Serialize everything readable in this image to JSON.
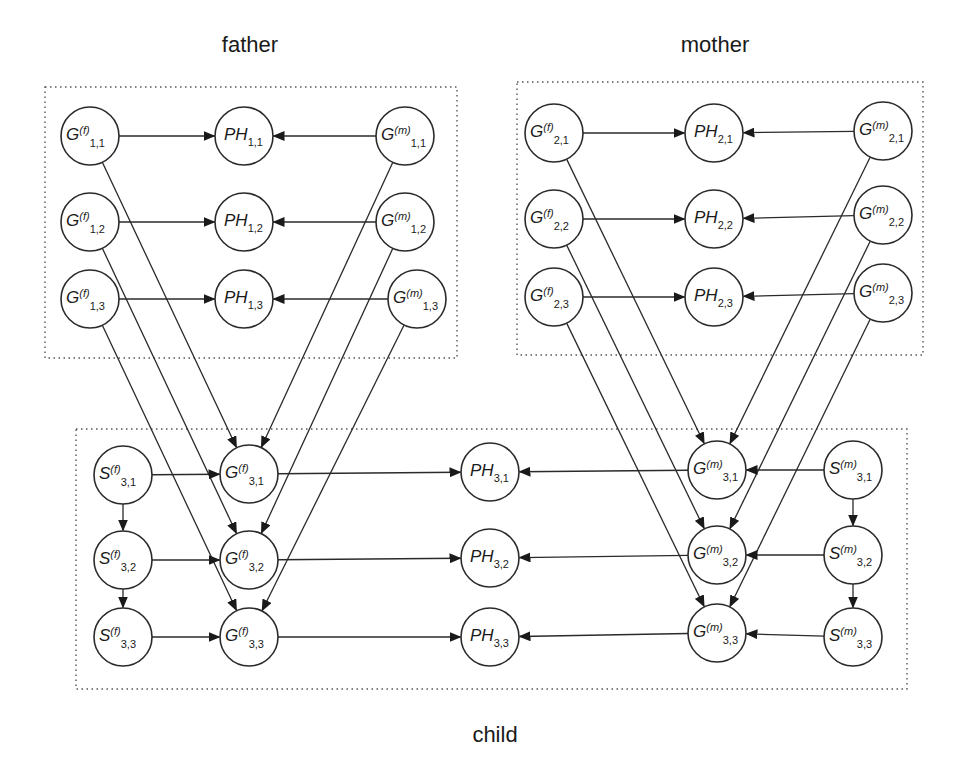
{
  "diagram": {
    "title_father": "father",
    "title_mother": "mother",
    "title_child": "child",
    "node_radius": 29,
    "colors": {
      "stroke": "#2a2a2a",
      "fill": "#ffffff",
      "text": "#1a1a1a"
    },
    "groups": [
      {
        "id": "father",
        "label": "father",
        "x": 45,
        "y": 87,
        "w": 412,
        "h": 271,
        "label_x": 250,
        "label_y": 52
      },
      {
        "id": "mother",
        "label": "mother",
        "x": 517,
        "y": 82,
        "w": 406,
        "h": 273,
        "label_x": 715,
        "label_y": 52
      },
      {
        "id": "child",
        "label": "child",
        "x": 76,
        "y": 429,
        "w": 831,
        "h": 260,
        "label_x": 495,
        "label_y": 742
      }
    ],
    "nodes": [
      {
        "id": "Gf11",
        "base": "G",
        "sup": "(f)",
        "sub": "1,1",
        "x": 90,
        "y": 136
      },
      {
        "id": "Gf12",
        "base": "G",
        "sup": "(f)",
        "sub": "1,2",
        "x": 90,
        "y": 222
      },
      {
        "id": "Gf13",
        "base": "G",
        "sup": "(f)",
        "sub": "1,3",
        "x": 90,
        "y": 299
      },
      {
        "id": "PH11",
        "base": "PH",
        "sup": "",
        "sub": "1,1",
        "x": 244,
        "y": 136
      },
      {
        "id": "PH12",
        "base": "PH",
        "sup": "",
        "sub": "1,2",
        "x": 244,
        "y": 222
      },
      {
        "id": "PH13",
        "base": "PH",
        "sup": "",
        "sub": "1,3",
        "x": 244,
        "y": 299
      },
      {
        "id": "Gm11",
        "base": "G",
        "sup": "(m)",
        "sub": "1,1",
        "x": 405,
        "y": 136
      },
      {
        "id": "Gm12",
        "base": "G",
        "sup": "(m)",
        "sub": "1,2",
        "x": 405,
        "y": 222
      },
      {
        "id": "Gm13",
        "base": "G",
        "sup": "(m)",
        "sub": "1,3",
        "x": 417,
        "y": 299
      },
      {
        "id": "Gf21",
        "base": "G",
        "sup": "(f)",
        "sub": "2,1",
        "x": 554,
        "y": 133
      },
      {
        "id": "Gf22",
        "base": "G",
        "sup": "(f)",
        "sub": "2,2",
        "x": 554,
        "y": 219
      },
      {
        "id": "Gf23",
        "base": "G",
        "sup": "(f)",
        "sub": "2,3",
        "x": 554,
        "y": 297
      },
      {
        "id": "PH21",
        "base": "PH",
        "sup": "",
        "sub": "2,1",
        "x": 714,
        "y": 133
      },
      {
        "id": "PH22",
        "base": "PH",
        "sup": "",
        "sub": "2,2",
        "x": 714,
        "y": 219
      },
      {
        "id": "PH23",
        "base": "PH",
        "sup": "",
        "sub": "2,3",
        "x": 714,
        "y": 297
      },
      {
        "id": "Gm21",
        "base": "G",
        "sup": "(m)",
        "sub": "2,1",
        "x": 883,
        "y": 131
      },
      {
        "id": "Gm22",
        "base": "G",
        "sup": "(m)",
        "sub": "2,2",
        "x": 883,
        "y": 215
      },
      {
        "id": "Gm23",
        "base": "G",
        "sup": "(m)",
        "sub": "2,3",
        "x": 883,
        "y": 293
      },
      {
        "id": "Sf31",
        "base": "S",
        "sup": "(f)",
        "sub": "3,1",
        "x": 123,
        "y": 475
      },
      {
        "id": "Sf32",
        "base": "S",
        "sup": "(f)",
        "sub": "3,2",
        "x": 123,
        "y": 560
      },
      {
        "id": "Sf33",
        "base": "S",
        "sup": "(f)",
        "sub": "3,3",
        "x": 123,
        "y": 637
      },
      {
        "id": "Gf31",
        "base": "G",
        "sup": "(f)",
        "sub": "3,1",
        "x": 249,
        "y": 474
      },
      {
        "id": "Gf32",
        "base": "G",
        "sup": "(f)",
        "sub": "3,2",
        "x": 249,
        "y": 560
      },
      {
        "id": "Gf33",
        "base": "G",
        "sup": "(f)",
        "sub": "3,3",
        "x": 249,
        "y": 637
      },
      {
        "id": "PH31",
        "base": "PH",
        "sup": "",
        "sub": "3,1",
        "x": 490,
        "y": 472
      },
      {
        "id": "PH32",
        "base": "PH",
        "sup": "",
        "sub": "3,2",
        "x": 490,
        "y": 558
      },
      {
        "id": "PH33",
        "base": "PH",
        "sup": "",
        "sub": "3,3",
        "x": 490,
        "y": 637
      },
      {
        "id": "Gm31",
        "base": "G",
        "sup": "(m)",
        "sub": "3,1",
        "x": 717,
        "y": 470
      },
      {
        "id": "Gm32",
        "base": "G",
        "sup": "(m)",
        "sub": "3,2",
        "x": 717,
        "y": 555
      },
      {
        "id": "Gm33",
        "base": "G",
        "sup": "(m)",
        "sub": "3,3",
        "x": 717,
        "y": 633
      },
      {
        "id": "Sm31",
        "base": "S",
        "sup": "(m)",
        "sub": "3,1",
        "x": 853,
        "y": 470
      },
      {
        "id": "Sm32",
        "base": "S",
        "sup": "(m)",
        "sub": "3,2",
        "x": 853,
        "y": 555
      },
      {
        "id": "Sm33",
        "base": "S",
        "sup": "(m)",
        "sub": "3,3",
        "x": 853,
        "y": 637
      }
    ],
    "edges": [
      [
        "Gf11",
        "PH11"
      ],
      [
        "Gm11",
        "PH11"
      ],
      [
        "Gf12",
        "PH12"
      ],
      [
        "Gm12",
        "PH12"
      ],
      [
        "Gf13",
        "PH13"
      ],
      [
        "Gm13",
        "PH13"
      ],
      [
        "Gf21",
        "PH21"
      ],
      [
        "Gm21",
        "PH21"
      ],
      [
        "Gf22",
        "PH22"
      ],
      [
        "Gm22",
        "PH22"
      ],
      [
        "Gf23",
        "PH23"
      ],
      [
        "Gm23",
        "PH23"
      ],
      [
        "Gf11",
        "Gf31"
      ],
      [
        "Gf12",
        "Gf32"
      ],
      [
        "Gf13",
        "Gf33"
      ],
      [
        "Gm11",
        "Gf31"
      ],
      [
        "Gm12",
        "Gf32"
      ],
      [
        "Gm13",
        "Gf33"
      ],
      [
        "Gf21",
        "Gm31"
      ],
      [
        "Gf22",
        "Gm32"
      ],
      [
        "Gf23",
        "Gm33"
      ],
      [
        "Gm21",
        "Gm31"
      ],
      [
        "Gm22",
        "Gm32"
      ],
      [
        "Gm23",
        "Gm33"
      ],
      [
        "Sf31",
        "Gf31"
      ],
      [
        "Sf32",
        "Gf32"
      ],
      [
        "Sf33",
        "Gf33"
      ],
      [
        "Sf31",
        "Sf32"
      ],
      [
        "Sf32",
        "Sf33"
      ],
      [
        "Sm31",
        "Gm31"
      ],
      [
        "Sm32",
        "Gm32"
      ],
      [
        "Sm33",
        "Gm33"
      ],
      [
        "Sm31",
        "Sm32"
      ],
      [
        "Sm32",
        "Sm33"
      ],
      [
        "Gf31",
        "PH31"
      ],
      [
        "Gm31",
        "PH31"
      ],
      [
        "Gf32",
        "PH32"
      ],
      [
        "Gm32",
        "PH32"
      ],
      [
        "Gf33",
        "PH33"
      ],
      [
        "Gm33",
        "PH33"
      ]
    ]
  }
}
